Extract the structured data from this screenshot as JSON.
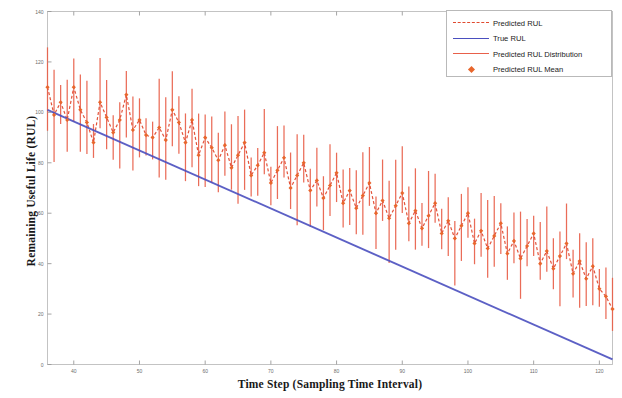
{
  "chart_data": {
    "type": "line",
    "title": "",
    "xlabel": "Time Step (Sampling Time Interval)",
    "ylabel": "Remaining Useful Life (RUL)",
    "xlim": [
      36,
      122
    ],
    "ylim": [
      0,
      140
    ],
    "xticks": [
      40,
      50,
      60,
      70,
      80,
      90,
      100,
      110,
      120
    ],
    "xtick_labels": [
      "40",
      "50",
      "60",
      "70",
      "80",
      "90",
      "100",
      "110",
      "120"
    ],
    "yticks": [
      0,
      20,
      40,
      60,
      80,
      100,
      120,
      140
    ],
    "ytick_labels": [
      "0",
      "20",
      "40",
      "60",
      "80",
      "100",
      "120",
      "140"
    ],
    "grid": false,
    "legend_position": "top-right",
    "series": [
      {
        "name": "True RUL",
        "type": "line",
        "color": "#4a4fbf",
        "style": "solid",
        "x": [
          36,
          122
        ],
        "values": [
          101,
          2
        ]
      },
      {
        "name": "Predicted RUL",
        "type": "line",
        "color": "#e04a2f",
        "style": "dashed",
        "marker": "diamond",
        "x": [
          36,
          37,
          38,
          39,
          40,
          41,
          42,
          43,
          44,
          45,
          46,
          47,
          48,
          49,
          50,
          51,
          52,
          53,
          54,
          55,
          56,
          57,
          58,
          59,
          60,
          61,
          62,
          63,
          64,
          65,
          66,
          67,
          68,
          69,
          70,
          71,
          72,
          73,
          74,
          75,
          76,
          77,
          78,
          79,
          80,
          81,
          82,
          83,
          84,
          85,
          86,
          87,
          88,
          89,
          90,
          91,
          92,
          93,
          94,
          95,
          96,
          97,
          98,
          99,
          100,
          101,
          102,
          103,
          104,
          105,
          106,
          107,
          108,
          109,
          110,
          111,
          112,
          113,
          114,
          115,
          116,
          117,
          118,
          119,
          120,
          121,
          122
        ],
        "values": [
          110,
          99,
          104,
          97,
          110,
          101,
          96,
          88,
          104,
          98,
          92,
          97,
          107,
          93,
          97,
          91,
          90,
          94,
          89,
          101,
          96,
          88,
          97,
          83,
          90,
          86,
          81,
          87,
          78,
          83,
          88,
          75,
          79,
          84,
          72,
          77,
          82,
          70,
          75,
          80,
          69,
          73,
          66,
          71,
          76,
          64,
          69,
          62,
          67,
          72,
          60,
          65,
          58,
          63,
          68,
          56,
          61,
          54,
          59,
          64,
          52,
          57,
          50,
          55,
          60,
          48,
          53,
          46,
          51,
          56,
          44,
          49,
          42,
          47,
          52,
          40,
          45,
          38,
          43,
          48,
          36,
          41,
          34,
          39,
          30,
          27,
          22
        ]
      },
      {
        "name": "Predicted RUL Mean",
        "type": "scatter",
        "color": "#e8662c",
        "marker": "diamond"
      },
      {
        "name": "Predicted RUL Distribution",
        "type": "errorbar",
        "color": "#e8604a",
        "description": "vertical confidence interval bars around each predicted mean"
      }
    ]
  },
  "axes": {
    "x_title": "Time Step (Sampling Time Interval)",
    "y_title": "Remaining Useful Life (RUL)"
  },
  "legend": {
    "items": [
      {
        "label": "Predicted RUL",
        "marker": "dashed-line",
        "color": "#e04a2f"
      },
      {
        "label": "True RUL",
        "marker": "solid-line",
        "color": "#4a4fbf"
      },
      {
        "label": "Predicted RUL Distribution",
        "marker": "solid-line",
        "color": "#e8604a"
      },
      {
        "label": "Predicted RUL Mean",
        "marker": "diamond",
        "color": "#e8662c"
      }
    ]
  }
}
